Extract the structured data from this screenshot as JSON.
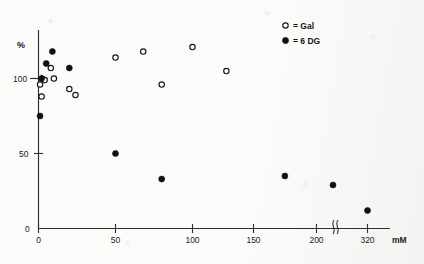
{
  "figure": {
    "background_color": "#fbfbfa",
    "ink_color": "#171717"
  },
  "axes": {
    "y_title": "%",
    "x_unit": "mM",
    "y_ticks": [
      "0",
      "50",
      "100"
    ],
    "x_ticks": [
      "0",
      "50",
      "100",
      "150",
      "200",
      "320"
    ],
    "axis_break_present": true,
    "reference_arrow_label": "100"
  },
  "legend": {
    "position": "top-right",
    "entries": [
      {
        "marker": "open-circle",
        "symbol": "o",
        "equals": "=",
        "label": "Gal"
      },
      {
        "marker": "filled-circle",
        "symbol": "●",
        "equals": "=",
        "label": "6 DG"
      }
    ]
  },
  "chart_data": {
    "type": "scatter",
    "title": "",
    "xlabel": "mM",
    "ylabel": "%",
    "xlim": [
      0,
      340
    ],
    "ylim": [
      0,
      140
    ],
    "xticks": [
      0,
      50,
      100,
      150,
      200,
      320
    ],
    "yticks": [
      0,
      50,
      100
    ],
    "grid": false,
    "legend_position": "top-right",
    "axis_break": {
      "axis": "x",
      "after": 200,
      "before": 320
    },
    "annotations": [
      {
        "text": "100",
        "type": "y-axis-arrow",
        "value": 100
      }
    ],
    "series": [
      {
        "name": "Gal",
        "marker": "open-circle",
        "points": [
          {
            "x": 1,
            "y": 96
          },
          {
            "x": 2,
            "y": 88
          },
          {
            "x": 4,
            "y": 99
          },
          {
            "x": 8,
            "y": 107
          },
          {
            "x": 10,
            "y": 100
          },
          {
            "x": 20,
            "y": 93
          },
          {
            "x": 24,
            "y": 89
          },
          {
            "x": 50,
            "y": 114
          },
          {
            "x": 68,
            "y": 118
          },
          {
            "x": 80,
            "y": 96
          },
          {
            "x": 100,
            "y": 121
          },
          {
            "x": 122,
            "y": 105
          }
        ]
      },
      {
        "name": "6 DG",
        "marker": "filled-circle",
        "points": [
          {
            "x": 1,
            "y": 75
          },
          {
            "x": 2,
            "y": 100
          },
          {
            "x": 5,
            "y": 110
          },
          {
            "x": 9,
            "y": 118
          },
          {
            "x": 20,
            "y": 107
          },
          {
            "x": 50,
            "y": 50
          },
          {
            "x": 80,
            "y": 33
          },
          {
            "x": 160,
            "y": 35
          },
          {
            "x": 205,
            "y": 29
          },
          {
            "x": 320,
            "y": 12
          }
        ]
      }
    ]
  }
}
